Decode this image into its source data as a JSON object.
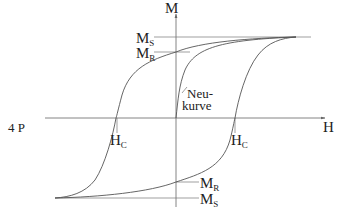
{
  "side_label": "4 P",
  "axes": {
    "y_label": "M",
    "x_label": "H"
  },
  "labels": {
    "ms_top": {
      "main": "M",
      "sub": "S"
    },
    "mr_top": {
      "main": "M",
      "sub": "R"
    },
    "mr_bottom": {
      "main": "M",
      "sub": "R"
    },
    "ms_bottom": {
      "main": "M",
      "sub": "S"
    },
    "hc_left": {
      "main": "H",
      "sub": "C"
    },
    "hc_right": {
      "main": "H",
      "sub": "C"
    },
    "virgin_curve_line1": "Neu-",
    "virgin_curve_line2": "kurve"
  },
  "colors": {
    "line": "#555555",
    "text": "#222222",
    "background": "#ffffff"
  }
}
